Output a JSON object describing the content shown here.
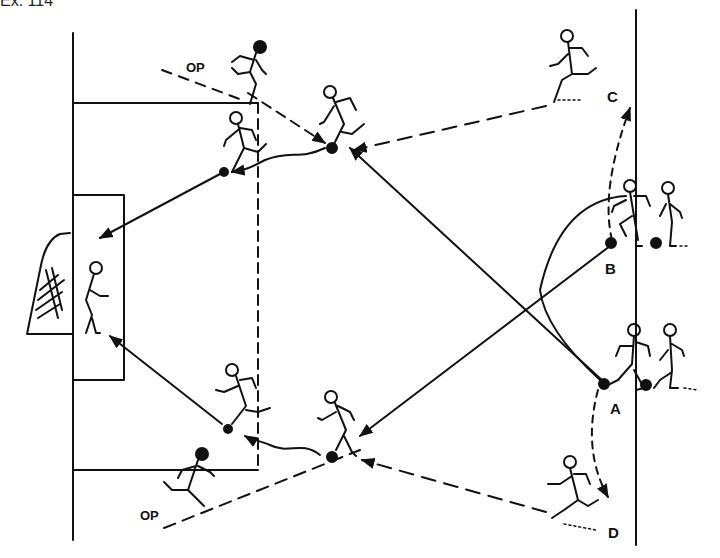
{
  "title": "Ex. 114",
  "diagram": {
    "type": "soccer-drill",
    "labels": {
      "op_top": "OP",
      "op_bottom": "OP",
      "c": "C",
      "b": "B",
      "a": "A",
      "d": "D"
    },
    "stations": [
      {
        "id": "A",
        "description": "player with ball at right touchline, lower"
      },
      {
        "id": "B",
        "description": "player with ball at right touchline, upper"
      },
      {
        "id": "C",
        "description": "runner top right"
      },
      {
        "id": "D",
        "description": "runner bottom right"
      }
    ],
    "colors": {
      "ink": "#111111",
      "paper": "#ffffff"
    }
  }
}
